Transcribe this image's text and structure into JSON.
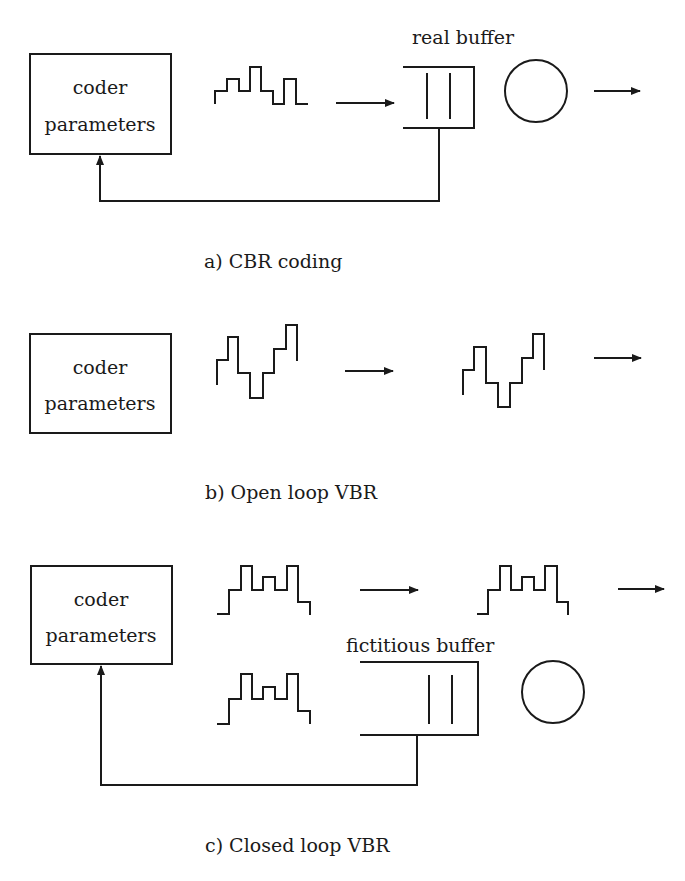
{
  "colors": {
    "ink": "#1a1a1a",
    "background": "#ffffff"
  },
  "panels": [
    {
      "id": "a",
      "caption": "a) CBR coding",
      "coder_box": {
        "line1": "coder",
        "line2": "parameters"
      },
      "buffer_label": "real buffer",
      "elements": [
        "coder-box",
        "bitstream-waveform",
        "arrow",
        "real-buffer",
        "server-circle",
        "output-arrow",
        "feedback-loop"
      ]
    },
    {
      "id": "b",
      "caption": "b) Open loop VBR",
      "coder_box": {
        "line1": "coder",
        "line2": "parameters"
      },
      "elements": [
        "coder-box",
        "bitstream-waveform",
        "arrow",
        "bitstream-waveform",
        "output-arrow"
      ]
    },
    {
      "id": "c",
      "caption": "c) Closed loop VBR",
      "coder_box": {
        "line1": "coder",
        "line2": "parameters"
      },
      "buffer_label": "fictitious buffer",
      "elements": [
        "coder-box",
        "bitstream-waveform",
        "arrow",
        "bitstream-waveform",
        "output-arrow",
        "bitstream-waveform",
        "fictitious-buffer",
        "server-circle",
        "feedback-loop"
      ]
    }
  ]
}
